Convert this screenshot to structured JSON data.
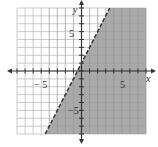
{
  "chart_data": {
    "type": "line",
    "title": "",
    "xlabel": "x",
    "ylabel": "y",
    "xlim": [
      -8,
      8
    ],
    "ylim": [
      -8,
      8
    ],
    "grid": true,
    "x_ticks_labeled": [
      "-5",
      "5"
    ],
    "y_ticks_labeled": [
      "5",
      "-5"
    ],
    "boundary_line": {
      "equation": "y = 2x + 1",
      "style": "dashed",
      "points": [
        [
          -4.5,
          -8
        ],
        [
          3.5,
          8
        ]
      ]
    },
    "shaded_region": "y < 2x + 1 (right/below the line)",
    "inequality": "y < 2x + 1"
  },
  "labels": {
    "x_axis": "x",
    "y_axis": "y",
    "x_neg": "− 5",
    "x_pos": "5",
    "y_pos": "5",
    "y_neg": "−5"
  },
  "colors": {
    "shade": "#9a9a9a",
    "grid": "#bdbdbd",
    "axis": "#333333"
  }
}
